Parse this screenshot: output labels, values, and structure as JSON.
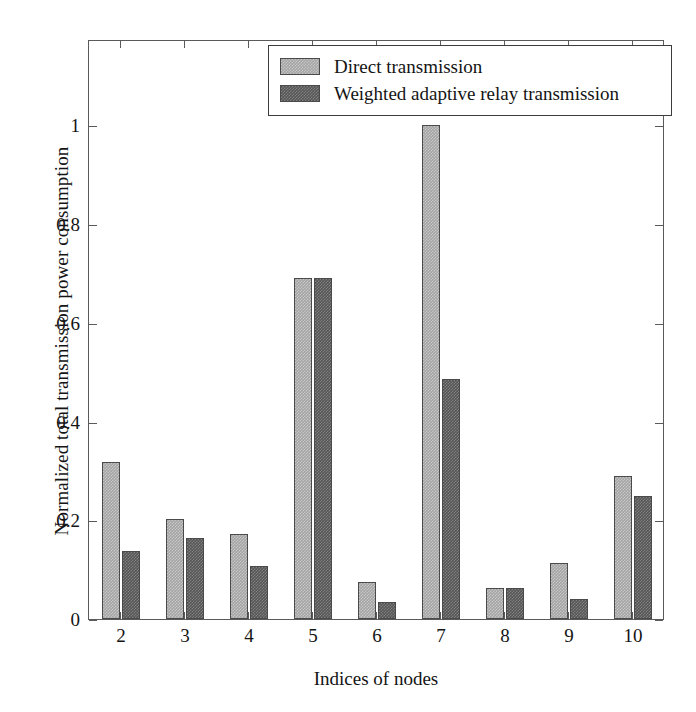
{
  "chart_data": {
    "type": "bar",
    "title": "",
    "xlabel": "Indices of nodes",
    "ylabel": "Normalized total transmission power consumption",
    "categories": [
      "2",
      "3",
      "4",
      "5",
      "6",
      "7",
      "8",
      "9",
      "10"
    ],
    "series": [
      {
        "name": "Direct transmission",
        "color": "#a5a5a5",
        "values": [
          0.317,
          0.202,
          0.173,
          0.69,
          0.075,
          1.0,
          0.062,
          0.113,
          0.29
        ]
      },
      {
        "name": "Weighted adaptive relay transmission",
        "color": "#565656",
        "values": [
          0.138,
          0.163,
          0.108,
          0.69,
          0.035,
          0.485,
          0.062,
          0.04,
          0.25
        ]
      }
    ],
    "ylim": [
      0,
      1.174
    ],
    "yticks": [
      0,
      0.2,
      0.4,
      0.6,
      0.8,
      1
    ],
    "ytick_labels": [
      "0",
      "0.2",
      "0.4",
      "0.6",
      "0.8",
      "1"
    ],
    "xtick_labels": [
      "2",
      "3",
      "4",
      "5",
      "6",
      "7",
      "8",
      "9",
      "10"
    ],
    "grid": false,
    "legend_position": "top-right",
    "axis_color": "#5a5a5a",
    "background": "#ffffff"
  }
}
